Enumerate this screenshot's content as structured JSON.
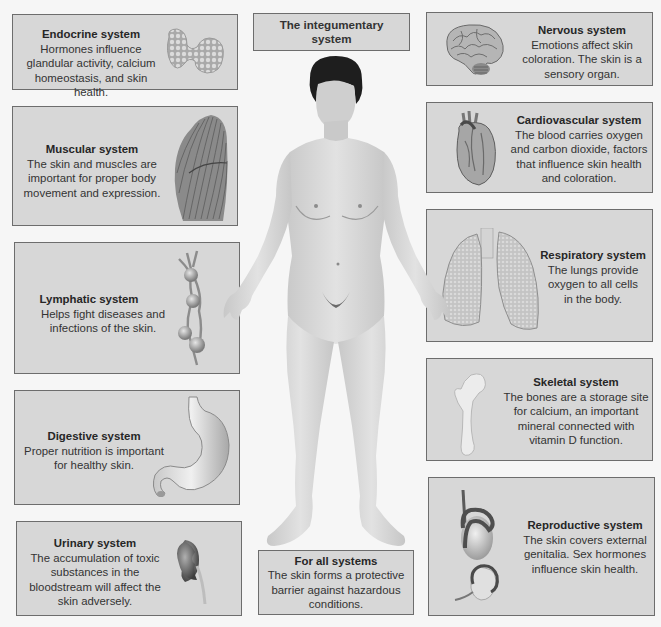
{
  "title": "The integumentary system",
  "title_lines": [
    "The integumentary",
    "system"
  ],
  "left_column": [
    {
      "id": "endocrine",
      "title": "Endocrine system",
      "description": "Hormones influence\nglandular activity, calcium\nhomeostasis, and skin health.",
      "illustration": "thyroid-gland-icon"
    },
    {
      "id": "muscular",
      "title": "Muscular system",
      "description": "The skin and muscles are\nimportant for proper body\nmovement and expression.",
      "illustration": "muscle-icon"
    },
    {
      "id": "lymphatic",
      "title": "Lymphatic system",
      "description": "Helps fight diseases and\ninfections of the skin.",
      "illustration": "lymph-nodes-icon"
    },
    {
      "id": "digestive",
      "title": "Digestive system",
      "description": "Proper nutrition is important\nfor healthy skin.",
      "illustration": "stomach-icon"
    },
    {
      "id": "urinary",
      "title": "Urinary system",
      "description": "The accumulation of toxic\nsubstances in the\nbloodstream will affect the\nskin adversely.",
      "illustration": "kidney-icon"
    }
  ],
  "right_column": [
    {
      "id": "nervous",
      "title": "Nervous system",
      "description": "Emotions affect skin\ncoloration. The skin is a\nsensory organ.",
      "illustration": "brain-icon"
    },
    {
      "id": "cardiovascular",
      "title": "Cardiovascular system",
      "description": "The blood carries oxygen\nand carbon dioxide, factors\nthat influence skin health\nand coloration.",
      "illustration": "heart-icon"
    },
    {
      "id": "respiratory",
      "title": "Respiratory system",
      "description": "The lungs provide\noxygen to all cells\nin the body.",
      "illustration": "lungs-icon"
    },
    {
      "id": "skeletal",
      "title": "Skeletal system",
      "description": "The bones are a storage site\nfor calcium, an important\nmineral connected with\nvitamin D function.",
      "illustration": "femur-bone-icon"
    },
    {
      "id": "reproductive",
      "title": "Reproductive system",
      "description": "The skin covers external\ngenitalia. Sex hormones\ninfluence skin health.",
      "illustration": "reproductive-organs-icon"
    }
  ],
  "bottom_center": {
    "id": "all",
    "title": "For all systems",
    "description": "The skin forms a protective\nbarrier against hazardous\nconditions."
  },
  "central_figure": "human-body-figure",
  "colors": {
    "box_fill": "#d7d7d7",
    "box_border": "#6d6d6d",
    "background": "#f6f6f6",
    "text": "#333333"
  }
}
